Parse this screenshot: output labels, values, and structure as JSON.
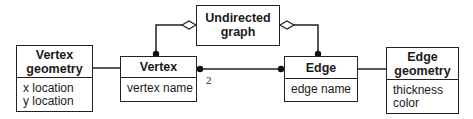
{
  "diagram": {
    "type": "class-diagram",
    "classes": [
      {
        "id": "undirected-graph",
        "name": [
          "Undirected",
          "graph"
        ],
        "attributes": []
      },
      {
        "id": "vertex-geometry",
        "name": [
          "Vertex",
          "geometry"
        ],
        "attributes": [
          "x location",
          "y location"
        ]
      },
      {
        "id": "vertex",
        "name": [
          "Vertex"
        ],
        "attributes": [
          "vertex name"
        ]
      },
      {
        "id": "edge",
        "name": [
          "Edge"
        ],
        "attributes": [
          "edge name"
        ]
      },
      {
        "id": "edge-geometry",
        "name": [
          "Edge",
          "geometry"
        ],
        "attributes": [
          "thickness",
          "color"
        ]
      }
    ],
    "relationships": [
      {
        "from": "undirected-graph",
        "to": "vertex",
        "kind": "aggregation",
        "multiplicity_to": "many"
      },
      {
        "from": "undirected-graph",
        "to": "edge",
        "kind": "aggregation",
        "multiplicity_to": "many"
      },
      {
        "from": "edge",
        "to": "vertex",
        "kind": "association",
        "multiplicity_vertex_end": "2",
        "multiplicity_edge_end": "many"
      },
      {
        "from": "vertex-geometry",
        "to": "vertex",
        "kind": "association"
      },
      {
        "from": "edge",
        "to": "edge-geometry",
        "kind": "association"
      }
    ],
    "multiplicity_label": "2"
  },
  "labels": {
    "undirected_graph": {
      "line1": "Undirected",
      "line2": "graph"
    },
    "vertex_geometry": {
      "line1": "Vertex",
      "line2": "geometry",
      "attr1": "x location",
      "attr2": "y location"
    },
    "vertex": {
      "title": "Vertex",
      "attr1": "vertex name"
    },
    "edge": {
      "title": "Edge",
      "attr1": "edge name"
    },
    "edge_geometry": {
      "line1": "Edge",
      "line2": "geometry",
      "attr1": "thickness",
      "attr2": "color"
    }
  }
}
